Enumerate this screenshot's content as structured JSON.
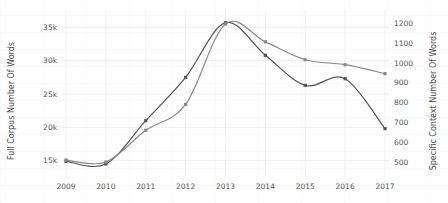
{
  "chart_data": {
    "type": "line",
    "title": "",
    "xlabel": "",
    "categories": [
      "2009",
      "2010",
      "2011",
      "2012",
      "2013",
      "2014",
      "2015",
      "2016",
      "2017"
    ],
    "x": [
      2009,
      2010,
      2011,
      2012,
      2013,
      2014,
      2015,
      2016,
      2017
    ],
    "grid": true,
    "legend": "none",
    "axes": {
      "left": {
        "label": "Full Corpus Number Of Words",
        "ticks": [
          15000,
          20000,
          25000,
          30000,
          35000
        ],
        "tick_labels": [
          "15k",
          "20k",
          "25k",
          "30k",
          "35k"
        ],
        "ylim": [
          13000,
          37000
        ]
      },
      "right": {
        "label": "Specific Context Number Of Words",
        "ticks": [
          500,
          600,
          700,
          800,
          900,
          1000,
          1100,
          1200
        ],
        "tick_labels": [
          "500",
          "600",
          "700",
          "800",
          "900",
          "1000",
          "1100",
          "1200"
        ],
        "ylim": [
          440,
          1245
        ]
      },
      "x": {
        "ticks": [
          2009,
          2010,
          2011,
          2012,
          2013,
          2014,
          2015,
          2016,
          2017
        ],
        "xlim": [
          2009,
          2017
        ]
      }
    },
    "series": [
      {
        "name": "Full Corpus Number Of Words",
        "axis": "left",
        "color": "#555555",
        "values": [
          14900,
          14500,
          21000,
          27500,
          35700,
          30800,
          26300,
          27300,
          19800
        ]
      },
      {
        "name": "Specific Context Number Of Words",
        "axis": "right",
        "color": "#8a8a8a",
        "values": [
          510,
          500,
          660,
          790,
          1195,
          1105,
          1015,
          990,
          945
        ]
      }
    ]
  }
}
